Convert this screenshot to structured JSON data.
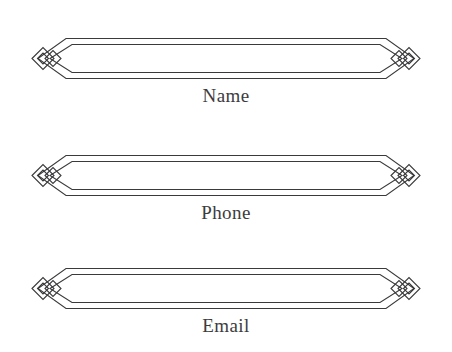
{
  "page": {
    "background_color": "#ffffff",
    "line_color": "#3a3a3c",
    "text_color": "#3c3c3e",
    "ornament_name": "interlocking-diamonds-ornament"
  },
  "form": {
    "fields": [
      {
        "key": "name",
        "label": "Name",
        "value": "",
        "placeholder": "",
        "left_ornament": "diamond-knot-left",
        "right_ornament": "diamond-knot-right"
      },
      {
        "key": "phone",
        "label": "Phone",
        "value": "",
        "placeholder": "",
        "left_ornament": "diamond-knot-left",
        "right_ornament": "diamond-knot-right"
      },
      {
        "key": "email",
        "label": "Email",
        "value": "",
        "placeholder": "",
        "left_ornament": "diamond-knot-right",
        "right_ornament": "diamond-knot-right"
      }
    ]
  }
}
